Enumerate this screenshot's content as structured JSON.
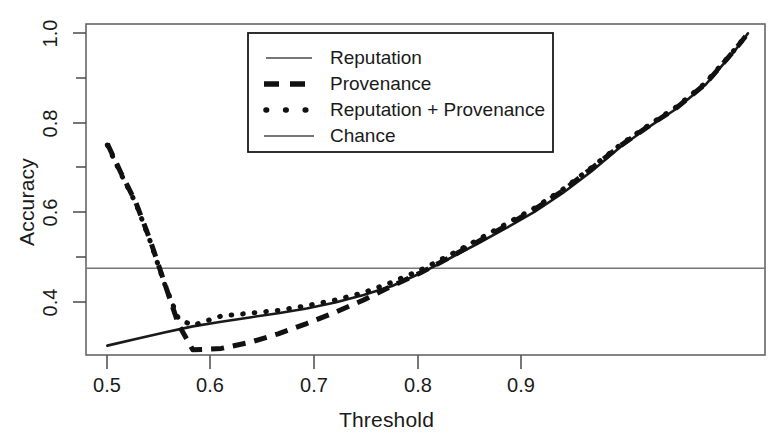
{
  "chart_data": {
    "type": "line",
    "title": "",
    "xlabel": "Threshold",
    "ylabel": "Accuracy",
    "xlim": [
      0.485,
      0.962
    ],
    "ylim": [
      0.315,
      1.02
    ],
    "grid": false,
    "legend_position": "top-center",
    "xticks": [
      0.5,
      0.6,
      0.7,
      0.8,
      0.9
    ],
    "xtick_labels": [
      "0.5",
      "0.6",
      "0.7",
      "0.8",
      "0.9"
    ],
    "yticks": [
      0.4,
      0.5,
      0.6,
      0.7,
      0.8,
      0.9,
      1.0
    ],
    "ytick_labels": [
      "0.4",
      "",
      "0.6",
      "",
      "0.8",
      "",
      "1.0"
    ],
    "ytick_labels_major": [
      "0.4",
      "0.6",
      "0.8",
      "1.0"
    ],
    "series": [
      {
        "name": "Reputation",
        "style": "solid",
        "color": "#1a1a1a",
        "x": [
          0.5,
          0.52,
          0.54,
          0.56,
          0.58,
          0.6,
          0.62,
          0.64,
          0.66,
          0.68,
          0.7,
          0.72,
          0.74,
          0.76,
          0.78,
          0.8,
          0.82,
          0.84,
          0.86,
          0.88,
          0.9,
          0.92,
          0.94,
          0.95
        ],
        "y": [
          0.335,
          0.349,
          0.363,
          0.376,
          0.386,
          0.395,
          0.404,
          0.414,
          0.427,
          0.443,
          0.462,
          0.489,
          0.52,
          0.552,
          0.585,
          0.62,
          0.66,
          0.706,
          0.757,
          0.8,
          0.84,
          0.89,
          0.96,
          1.0
        ]
      },
      {
        "name": "Provenance",
        "style": "dashed",
        "color": "#111111",
        "x": [
          0.5,
          0.51,
          0.52,
          0.53,
          0.54,
          0.55,
          0.56,
          0.58,
          0.6,
          0.62,
          0.64,
          0.66,
          0.68,
          0.7,
          0.72,
          0.74,
          0.76,
          0.78,
          0.8,
          0.82,
          0.84,
          0.86,
          0.88,
          0.9,
          0.92,
          0.94,
          0.95
        ],
        "y": [
          0.765,
          0.7,
          0.64,
          0.56,
          0.47,
          0.38,
          0.326,
          0.329,
          0.342,
          0.36,
          0.382,
          0.406,
          0.432,
          0.462,
          0.49,
          0.522,
          0.556,
          0.59,
          0.625,
          0.665,
          0.712,
          0.76,
          0.802,
          0.842,
          0.892,
          0.962,
          1.0
        ]
      },
      {
        "name": "Reputation + Provenance",
        "style": "dotted",
        "color": "#111111",
        "x": [
          0.5,
          0.51,
          0.52,
          0.53,
          0.54,
          0.55,
          0.56,
          0.58,
          0.6,
          0.62,
          0.64,
          0.66,
          0.68,
          0.7,
          0.72,
          0.74,
          0.76,
          0.78,
          0.8,
          0.82,
          0.84,
          0.86,
          0.88,
          0.9,
          0.92,
          0.94,
          0.95
        ],
        "y": [
          0.762,
          0.698,
          0.638,
          0.558,
          0.468,
          0.392,
          0.378,
          0.398,
          0.404,
          0.41,
          0.42,
          0.432,
          0.448,
          0.47,
          0.496,
          0.527,
          0.56,
          0.594,
          0.628,
          0.668,
          0.714,
          0.762,
          0.804,
          0.844,
          0.894,
          0.963,
          1.0
        ]
      },
      {
        "name": "Chance",
        "style": "solid-thin",
        "color": "#777777",
        "x": [
          0.485,
          0.962
        ],
        "y": [
          0.5,
          0.5
        ]
      }
    ]
  },
  "legend": {
    "entries": [
      {
        "label": "Reputation",
        "sample": "solid-line-sample"
      },
      {
        "label": "Provenance",
        "sample": "dashed-line-sample"
      },
      {
        "label": "Reputation + Provenance",
        "sample": "dotted-line-sample"
      },
      {
        "label": "Chance",
        "sample": "thin-solid-line-sample"
      }
    ]
  },
  "axes": {
    "x_title": "Threshold",
    "y_title": "Accuracy",
    "x_tick_labels": [
      "0.5",
      "0.6",
      "0.7",
      "0.8",
      "0.9"
    ],
    "y_tick_labels": [
      "1.0",
      "0.8",
      "0.6",
      "0.4"
    ]
  }
}
